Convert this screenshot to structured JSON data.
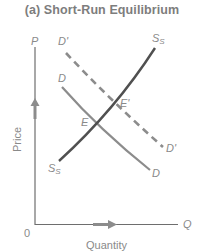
{
  "title": "(a)  Short-Run Equilibrium",
  "axes": {
    "y_symbol": "P",
    "x_symbol": "Q",
    "origin": "0",
    "y_label": "Price",
    "x_label": "Quantity"
  },
  "curves": {
    "supply_top": "S",
    "supply_top_sub": "S",
    "supply_bottom": "S",
    "supply_bottom_sub": "S",
    "demand_top": "D",
    "demand_bottom": "D",
    "demand_shift_top": "D'",
    "demand_shift_bottom": "D'"
  },
  "points": {
    "initial": "E",
    "new": "E'"
  },
  "colors": {
    "axis": "#6e6e6e",
    "supply": "#505050",
    "demand": "#8c8c8c",
    "demand_shift": "#8c8c8c",
    "arrow": "#8c8c8c",
    "text": "#8a8a8a"
  }
}
